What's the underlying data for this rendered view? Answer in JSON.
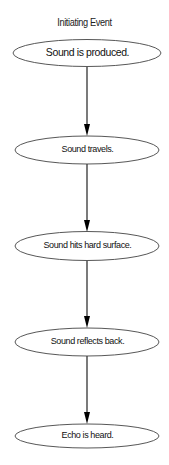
{
  "diagram": {
    "title": "Initiating Event",
    "type": "flowchart",
    "direction": "top-to-bottom",
    "nodes": [
      {
        "id": "n1",
        "label": "Sound is produced.",
        "shape": "ellipse",
        "cy": 53,
        "rx": 74,
        "ry": 13.5,
        "label_top": 47
      },
      {
        "id": "n2",
        "label": "Sound travels.",
        "shape": "ellipse",
        "cy": 150,
        "rx": 72,
        "ry": 14,
        "label_top": 144
      },
      {
        "id": "n3",
        "label": "Sound hits hard surface.",
        "shape": "ellipse",
        "cy": 246,
        "rx": 72,
        "ry": 14.5,
        "label_top": 240
      },
      {
        "id": "n4",
        "label": "Sound reflects back.",
        "shape": "ellipse",
        "cy": 342,
        "rx": 72,
        "ry": 14,
        "label_top": 336
      },
      {
        "id": "n5",
        "label": "Echo is heard.",
        "shape": "ellipse",
        "cy": 436,
        "rx": 72,
        "ry": 12,
        "label_top": 430
      }
    ],
    "edges": [
      {
        "from": "n1",
        "to": "n2"
      },
      {
        "from": "n2",
        "to": "n3"
      },
      {
        "from": "n3",
        "to": "n4"
      },
      {
        "from": "n4",
        "to": "n5"
      }
    ],
    "colors": {
      "stroke": "#333333",
      "arrow": "#000000",
      "fill": "#ffffff",
      "text": "#111111"
    }
  }
}
